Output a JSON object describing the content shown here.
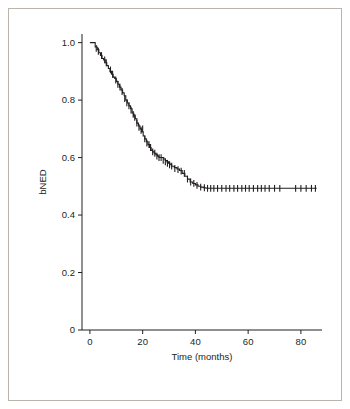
{
  "figure": {
    "border_color": "#b9b5ac",
    "background": "#ffffff"
  },
  "chart_data": {
    "type": "line",
    "title": "",
    "subtitle": "",
    "xlabel": "Time (months)",
    "ylabel": "bNED",
    "xlim": [
      -3,
      88
    ],
    "ylim": [
      0,
      1.03
    ],
    "xticks": [
      0,
      20,
      40,
      60,
      80
    ],
    "xtick_labels": [
      "0",
      "20",
      "40",
      "60",
      "80"
    ],
    "yticks": [
      0,
      0.2,
      0.4,
      0.6,
      0.8,
      1.0
    ],
    "ytick_labels": [
      "0",
      "0.2",
      "0.4",
      "0.6",
      "0.8",
      "1.0"
    ],
    "grid": false,
    "legend": null,
    "line_color": "#231f20",
    "line_width": 1.1,
    "censor_marks": true,
    "censor_mark_color": "#231f20",
    "series": [
      {
        "name": "bNED",
        "step": "post",
        "x": [
          0,
          1.2,
          2.0,
          2.8,
          3.4,
          4.0,
          4.6,
          5.2,
          5.8,
          6.4,
          7.0,
          7.6,
          8.2,
          8.8,
          9.4,
          10.0,
          10.6,
          11.2,
          11.8,
          12.4,
          13.0,
          13.6,
          14.2,
          14.8,
          15.4,
          16.0,
          16.6,
          17.2,
          17.8,
          18.4,
          19.0,
          19.6,
          20.2,
          20.8,
          21.4,
          22.0,
          22.6,
          23.2,
          23.8,
          24.4,
          25.0,
          25.6,
          26.2,
          26.8,
          27.4,
          28.0,
          28.6,
          29.2,
          29.8,
          30.4,
          31.0,
          32.0,
          33.0,
          34.0,
          35.0,
          36.0,
          37.0,
          38.0,
          39.0,
          40.0,
          41.0,
          42.0,
          43.0,
          44.0,
          86.0
        ],
        "y": [
          1.0,
          1.0,
          0.985,
          0.975,
          0.965,
          0.955,
          0.945,
          0.94,
          0.93,
          0.92,
          0.91,
          0.9,
          0.89,
          0.88,
          0.875,
          0.865,
          0.855,
          0.845,
          0.835,
          0.825,
          0.815,
          0.8,
          0.79,
          0.78,
          0.77,
          0.755,
          0.745,
          0.735,
          0.72,
          0.71,
          0.7,
          0.69,
          0.675,
          0.665,
          0.655,
          0.645,
          0.635,
          0.625,
          0.62,
          0.615,
          0.61,
          0.605,
          0.6,
          0.6,
          0.6,
          0.595,
          0.59,
          0.585,
          0.58,
          0.575,
          0.57,
          0.565,
          0.56,
          0.555,
          0.545,
          0.535,
          0.525,
          0.515,
          0.51,
          0.505,
          0.5,
          0.497,
          0.495,
          0.493,
          0.493
        ]
      }
    ],
    "censor_x": [
      2.4,
      3.2,
      4.4,
      5.6,
      6.2,
      7.8,
      8.6,
      9.8,
      10.6,
      11.4,
      12.2,
      13.2,
      14.0,
      14.8,
      15.6,
      16.4,
      17.0,
      17.8,
      18.6,
      19.4,
      20.0,
      20.8,
      21.6,
      22.4,
      23.0,
      23.8,
      24.6,
      25.4,
      26.2,
      27.0,
      27.8,
      28.6,
      29.4,
      30.2,
      31.0,
      32.2,
      33.4,
      34.6,
      35.8,
      37.0,
      38.2,
      39.4,
      40.6,
      42.0,
      43.4,
      44.6,
      45.8,
      47.0,
      48.4,
      50.0,
      51.6,
      53.0,
      54.6,
      56.0,
      57.6,
      59.0,
      60.4,
      62.0,
      63.6,
      65.0,
      66.4,
      68.0,
      70.0,
      72.0,
      78.0,
      80.0,
      82.0,
      84.0,
      85.5
    ],
    "censor_y": [
      0.98,
      0.97,
      0.955,
      0.94,
      0.93,
      0.905,
      0.89,
      0.87,
      0.855,
      0.845,
      0.83,
      0.805,
      0.79,
      0.78,
      0.765,
      0.75,
      0.74,
      0.72,
      0.705,
      0.695,
      0.7,
      0.665,
      0.65,
      0.645,
      0.635,
      0.62,
      0.615,
      0.605,
      0.6,
      0.6,
      0.59,
      0.585,
      0.58,
      0.575,
      0.57,
      0.562,
      0.558,
      0.553,
      0.545,
      0.525,
      0.515,
      0.51,
      0.503,
      0.497,
      0.495,
      0.493,
      0.493,
      0.493,
      0.493,
      0.493,
      0.493,
      0.493,
      0.493,
      0.493,
      0.493,
      0.493,
      0.493,
      0.493,
      0.493,
      0.493,
      0.493,
      0.493,
      0.493,
      0.493,
      0.493,
      0.493,
      0.493,
      0.493,
      0.493
    ]
  }
}
